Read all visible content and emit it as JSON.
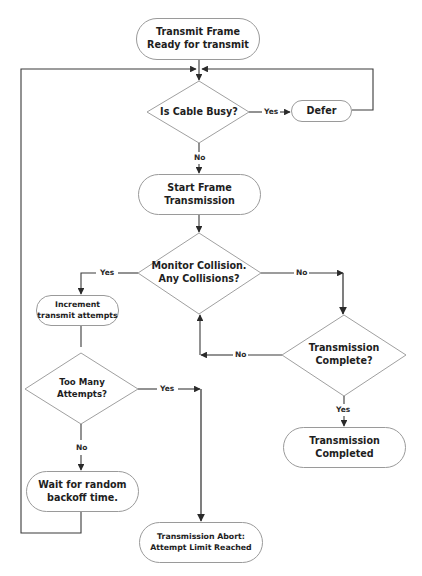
{
  "diagram": {
    "type": "flowchart",
    "nodes": {
      "start": {
        "shape": "terminator",
        "line1": "Transmit Frame",
        "line2": "Ready for transmit"
      },
      "cable_busy": {
        "shape": "decision",
        "line1": "Is Cable Busy?"
      },
      "defer": {
        "shape": "terminator",
        "line1": "Defer"
      },
      "start_tx": {
        "shape": "terminator",
        "line1": "Start Frame",
        "line2": "Transmission"
      },
      "monitor": {
        "shape": "decision",
        "line1": "Monitor Collision.",
        "line2": "Any Collisions?"
      },
      "increment": {
        "shape": "terminator",
        "line1": "Increment",
        "line2": "transmit attempts"
      },
      "tx_complete": {
        "shape": "decision",
        "line1": "Transmission",
        "line2": "Complete?"
      },
      "too_many": {
        "shape": "decision",
        "line1": "Too Many",
        "line2": "Attempts?"
      },
      "completed": {
        "shape": "terminator",
        "line1": "Transmission",
        "line2": "Completed"
      },
      "backoff": {
        "shape": "terminator",
        "line1": "Wait for random",
        "line2": "backoff time."
      },
      "abort": {
        "shape": "terminator",
        "line1": "Transmission Abort:",
        "line2": "Attempt Limit Reached"
      }
    },
    "edges": [
      {
        "from": "start",
        "to": "cable_busy",
        "label": ""
      },
      {
        "from": "cable_busy",
        "to": "defer",
        "label": "Yes"
      },
      {
        "from": "defer",
        "to": "cable_busy",
        "label": ""
      },
      {
        "from": "cable_busy",
        "to": "start_tx",
        "label": "No"
      },
      {
        "from": "start_tx",
        "to": "monitor",
        "label": ""
      },
      {
        "from": "monitor",
        "to": "increment",
        "label": "Yes"
      },
      {
        "from": "monitor",
        "to": "tx_complete",
        "label": "No"
      },
      {
        "from": "tx_complete",
        "to": "monitor",
        "label": "No"
      },
      {
        "from": "tx_complete",
        "to": "completed",
        "label": "Yes"
      },
      {
        "from": "increment",
        "to": "too_many",
        "label": ""
      },
      {
        "from": "too_many",
        "to": "abort",
        "label": "Yes"
      },
      {
        "from": "too_many",
        "to": "backoff",
        "label": "No"
      },
      {
        "from": "backoff",
        "to": "cable_busy",
        "label": ""
      }
    ],
    "labels": {
      "yes": "Yes",
      "no": "No"
    },
    "colors": {
      "line": "#3a3a3a",
      "outline": "#9a9a9a",
      "text": "#1e1e1e",
      "background": "#ffffff"
    }
  }
}
